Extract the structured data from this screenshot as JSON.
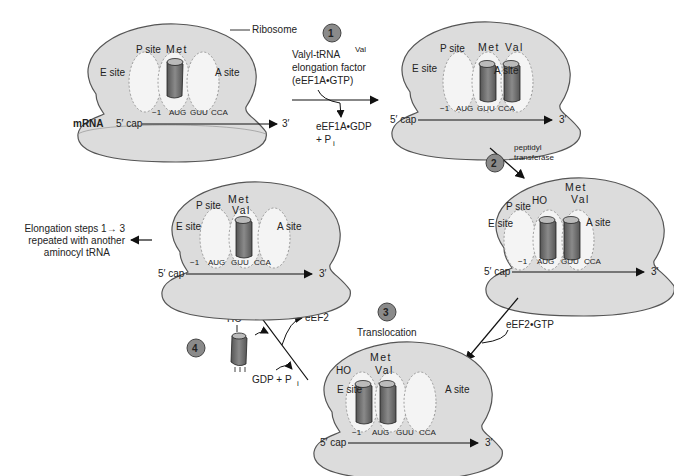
{
  "labels": {
    "ribosome": "Ribosome",
    "mrna": "mRNA",
    "cap": "5′ cap",
    "three_prime": "3′",
    "e_site": "E site",
    "p_site": "P site",
    "a_site": "A site",
    "met": "Met",
    "val": "Val",
    "ho": "HO",
    "codons": [
      "−1",
      "AUG",
      "GUU",
      "CCA"
    ]
  },
  "steps": [
    {
      "number": "1",
      "input_line1": "Valyl-tRNA",
      "input_sup": "Val",
      "input_line2": "elongation factor",
      "input_line3": "(eEF1A•GTP)",
      "output_line1": "eEF1A•GDP",
      "output_line2": "+ P",
      "output_sub": "i"
    },
    {
      "number": "2",
      "label_line1": "peptidyl",
      "label_line2": "transferase"
    },
    {
      "number": "3",
      "label": "Translocation",
      "input": "eEF2•GTP"
    },
    {
      "number": "4",
      "output_eef2": "eEF2",
      "output_gdp": "GDP + P",
      "output_sub": "i"
    }
  ],
  "repeat_note": [
    "Elongation steps 1→ 3",
    "repeated with another",
    "aminocyl tRNA"
  ],
  "colors": {
    "ribosome_fill": "#dcdcdc",
    "ribosome_stroke": "#555555",
    "site_fill": "#f4f4f4",
    "trna_fill": "#777777",
    "step_badge": "#8a8a8a"
  }
}
